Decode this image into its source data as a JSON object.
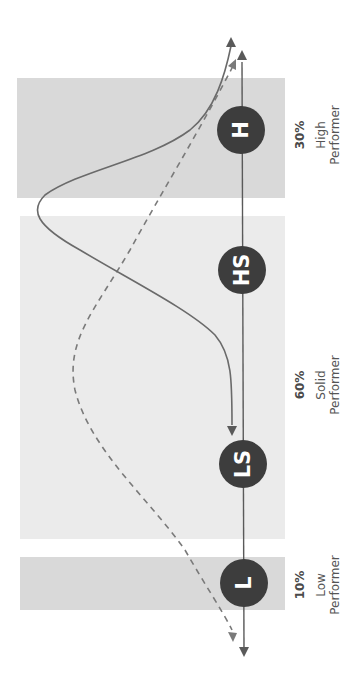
{
  "diagram": {
    "orientation": "rotated-90-clockwise",
    "colors": {
      "band_dark": "#d9d9d9",
      "band_light": "#ebebeb",
      "node_fill": "#3d3d3d",
      "node_text": "#ffffff",
      "line": "#5a5a5a"
    },
    "segments": [
      {
        "id": "high",
        "percent": "30%",
        "label_line1": "High",
        "label_line2": "Performer"
      },
      {
        "id": "solid",
        "percent": "60%",
        "label_line1": "Solid",
        "label_line2": "Performer"
      },
      {
        "id": "low",
        "percent": "10%",
        "label_line1": "Low",
        "label_line2": "Performer"
      }
    ],
    "nodes": [
      {
        "id": "H",
        "label": "H"
      },
      {
        "id": "HS",
        "label": "HS"
      },
      {
        "id": "LS",
        "label": "LS"
      },
      {
        "id": "L",
        "label": "L"
      }
    ],
    "curves": [
      {
        "id": "solid-curve",
        "style": "solid",
        "description": "skewed distribution peaking near High/Solid boundary, arrow down into LS"
      },
      {
        "id": "dashed-curve",
        "style": "dashed",
        "description": "bell-shaped distribution centered in Solid Performer segment"
      }
    ]
  }
}
